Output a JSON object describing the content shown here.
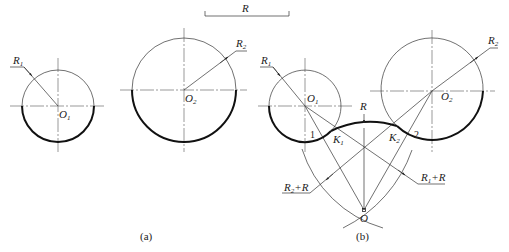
{
  "reference": {
    "label": "R"
  },
  "figure_a": {
    "caption": "(a)",
    "circle1": {
      "radius_label": "R",
      "radius_sub": "1",
      "center_label": "O",
      "center_sub": "1"
    },
    "circle2": {
      "radius_label": "R",
      "radius_sub": "2",
      "center_label": "O",
      "center_sub": "2"
    }
  },
  "figure_b": {
    "caption": "(b)",
    "circle1": {
      "radius_label": "R",
      "radius_sub": "1",
      "center_label": "O",
      "center_sub": "1"
    },
    "circle2": {
      "radius_label": "R",
      "radius_sub": "2",
      "center_label": "O",
      "center_sub": "2"
    },
    "arc_label": "R",
    "tangent_points": [
      {
        "label": "K",
        "sub": "1"
      },
      {
        "label": "K",
        "sub": "2"
      }
    ],
    "point_numbers": [
      "1",
      "2"
    ],
    "construction_labels": {
      "r2_plus_r": {
        "base": "R",
        "sub": "2",
        "rest": "+R"
      },
      "r1_plus_r": {
        "base": "R",
        "sub": "1",
        "rest": "+R"
      }
    },
    "arc_center_label": "O"
  },
  "colors": {
    "line": "#333333",
    "thick": "#111111",
    "background": "#ffffff"
  }
}
